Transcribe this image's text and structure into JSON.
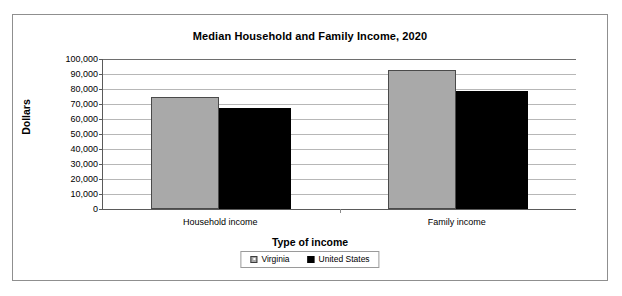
{
  "chart_data": {
    "type": "bar",
    "title": "Median Household and Family Income, 2020",
    "xlabel": "Type of income",
    "ylabel": "Dollars",
    "categories": [
      "Household income",
      "Family income"
    ],
    "series": [
      {
        "name": "Virginia",
        "color": "#a9a9a9",
        "values": [
          74700,
          92700
        ]
      },
      {
        "name": "United States",
        "color": "#000000",
        "values": [
          67300,
          78700
        ]
      }
    ],
    "ylim": [
      0,
      100000
    ],
    "ytick_labels": [
      "100,000",
      "90,000",
      "80,000",
      "70,000",
      "60,000",
      "50,000",
      "40,000",
      "30,000",
      "20,000",
      "10,000",
      "0"
    ],
    "ytick_values": [
      100000,
      90000,
      80000,
      70000,
      60000,
      50000,
      40000,
      30000,
      20000,
      10000,
      0
    ],
    "grid": true,
    "legend_position": "bottom"
  },
  "legend": {
    "entries": [
      {
        "label": "Virginia",
        "swatch": "gray-square-icon"
      },
      {
        "label": "United States",
        "swatch": "black-square-icon"
      }
    ]
  }
}
